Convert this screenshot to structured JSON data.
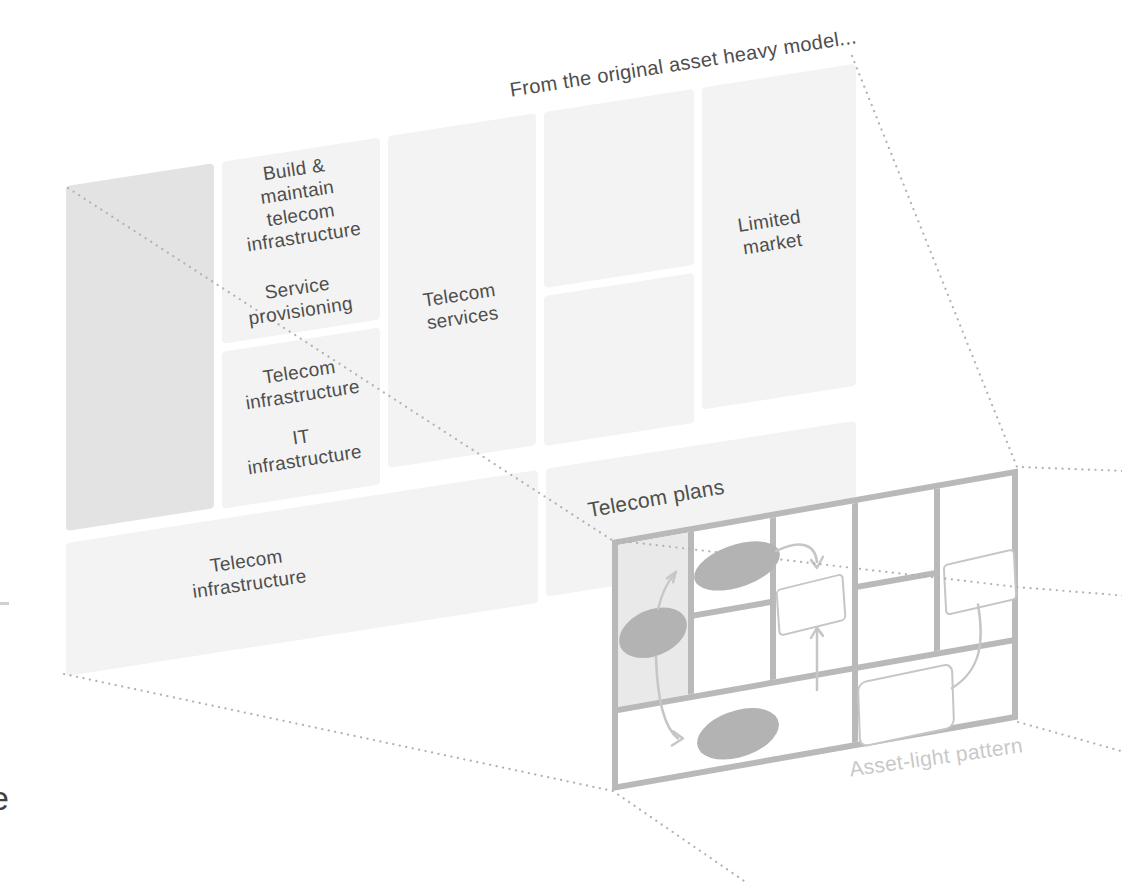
{
  "title": "From the original asset heavy model...",
  "colors": {
    "canvas_grid": "#b9b9b9",
    "block_fill": "#f3f3f3",
    "block_fill_shaded": "#e3e3e3",
    "small_shaded": "#e9e9e9",
    "ellipse_fill": "#b3b3b3",
    "sketch_outline": "#c6c6c6",
    "dotted_line": "#b2b2b2",
    "label_text": "#4e4e4e",
    "muted_label": "#c9c9c9"
  },
  "big_canvas": {
    "labels": {
      "key_activities_1": "Build &\nmaintain\ntelecom\ninfrastructure",
      "key_activities_2": "Service\nprovisioning",
      "key_resources_1": "Telecom\ninfrastructure",
      "key_resources_2": "IT\ninfrastructure",
      "value_proposition": "Telecom\nservices",
      "customer_segment": "Limited\nmarket",
      "cost_structure": "Telecom\ninfrastructure"
    }
  },
  "small_canvas": {
    "caption": "Telecom plans",
    "pattern_label": "Asset-light pattern"
  },
  "page_edge": {
    "letter": "e"
  }
}
